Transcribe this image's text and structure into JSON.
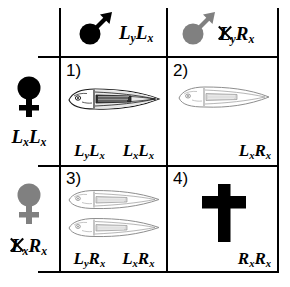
{
  "figure": {
    "type": "punnett-square",
    "columns": [
      {
        "id": "col-1",
        "symbol": "male-symbol",
        "symbol_color": "#000000",
        "genotype": "LyLx",
        "allele_1": "L",
        "allele_1_sub": "y",
        "allele_2": "L",
        "allele_2_sub": "x",
        "lethal": false
      },
      {
        "id": "col-2",
        "symbol": "male-symbol",
        "symbol_color": "#808080",
        "genotype": "LyRx",
        "allele_1": "L",
        "allele_1_sub": "y",
        "allele_2": "R",
        "allele_2_sub": "x",
        "lethal": true
      }
    ],
    "rows": [
      {
        "id": "row-1",
        "symbol": "female-symbol",
        "symbol_color": "#000000",
        "genotype": "LxLx",
        "allele_1": "L",
        "allele_1_sub": "x",
        "allele_2": "L",
        "allele_2_sub": "x",
        "lethal": false
      },
      {
        "id": "row-2",
        "symbol": "female-symbol",
        "symbol_color": "#808080",
        "genotype": "LxRx",
        "allele_1": "L",
        "allele_1_sub": "x",
        "allele_2": "R",
        "allele_2_sub": "x",
        "lethal": true
      }
    ],
    "cells": [
      {
        "id": "cell-1",
        "number": "1)",
        "content": "larva",
        "larva_count": 1,
        "larva_style": "dark",
        "genotypes": [
          {
            "a1": "L",
            "s1": "y",
            "a2": "L",
            "s2": "x"
          },
          {
            "a1": "L",
            "s1": "x",
            "a2": "L",
            "s2": "x"
          }
        ]
      },
      {
        "id": "cell-2",
        "number": "2)",
        "content": "larva",
        "larva_count": 1,
        "larva_style": "faint",
        "genotypes": [
          {
            "a1": "L",
            "s1": "x",
            "a2": "R",
            "s2": "x"
          }
        ]
      },
      {
        "id": "cell-3",
        "number": "3)",
        "content": "larva",
        "larva_count": 2,
        "larva_style": "faint",
        "genotypes": [
          {
            "a1": "L",
            "s1": "y",
            "a2": "R",
            "s2": "x"
          },
          {
            "a1": "L",
            "s1": "x",
            "a2": "R",
            "s2": "x"
          }
        ]
      },
      {
        "id": "cell-4",
        "number": "4)",
        "content": "death-cross",
        "larva_count": 0,
        "larva_style": "none",
        "genotypes": [
          {
            "a1": "R",
            "s1": "x",
            "a2": "R",
            "s2": "x"
          }
        ]
      }
    ],
    "icons": {
      "male": "mars-symbol",
      "female": "venus-symbol",
      "dead": "cross-symbol",
      "organism": "fish-larva"
    },
    "colors": {
      "line": "#000000",
      "gray": "#808080",
      "background": "#ffffff"
    }
  }
}
